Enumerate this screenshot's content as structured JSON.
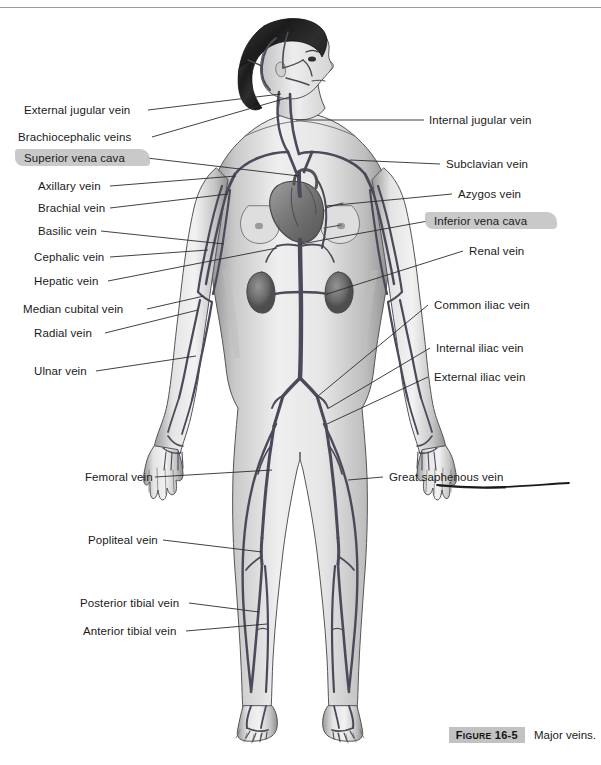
{
  "page": {
    "background_color": "#ffffff",
    "width": 601,
    "height": 765,
    "top_rule_color": "#9b9b9b"
  },
  "figure": {
    "style": "grayscale medical illustration",
    "organs_depicted": [
      "heart",
      "liver region",
      "left kidney",
      "right kidney"
    ],
    "highlight_color": "#c4c4c4",
    "leader_line_color": "#2a2a2a"
  },
  "labels_left": [
    {
      "id": "external-jugular-vein",
      "text": "External jugular vein",
      "highlighted": false
    },
    {
      "id": "brachiocephalic-veins",
      "text": "Brachiocephalic veins",
      "highlighted": false
    },
    {
      "id": "superior-vena-cava",
      "text": "Superior vena cava",
      "highlighted": true
    },
    {
      "id": "axillary-vein",
      "text": "Axillary vein",
      "highlighted": false
    },
    {
      "id": "brachial-vein",
      "text": "Brachial vein",
      "highlighted": false
    },
    {
      "id": "basilic-vein",
      "text": "Basilic vein",
      "highlighted": false
    },
    {
      "id": "cephalic-vein",
      "text": "Cephalic vein",
      "highlighted": false
    },
    {
      "id": "hepatic-vein",
      "text": "Hepatic vein",
      "highlighted": false
    },
    {
      "id": "median-cubital-vein",
      "text": "Median cubital vein",
      "highlighted": false
    },
    {
      "id": "radial-vein",
      "text": "Radial vein",
      "highlighted": false
    },
    {
      "id": "ulnar-vein",
      "text": "Ulnar vein",
      "highlighted": false
    },
    {
      "id": "femoral-vein",
      "text": "Femoral vein",
      "highlighted": false
    },
    {
      "id": "popliteal-vein",
      "text": "Popliteal vein",
      "highlighted": false
    },
    {
      "id": "posterior-tibial-vein",
      "text": "Posterior tibial vein",
      "highlighted": false
    },
    {
      "id": "anterior-tibial-vein",
      "text": "Anterior tibial vein",
      "highlighted": false
    }
  ],
  "labels_right": [
    {
      "id": "internal-jugular-vein",
      "text": "Internal jugular vein",
      "highlighted": false
    },
    {
      "id": "subclavian-vein",
      "text": "Subclavian vein",
      "highlighted": false
    },
    {
      "id": "azygos-vein",
      "text": "Azygos vein",
      "highlighted": false
    },
    {
      "id": "inferior-vena-cava",
      "text": "Inferior vena cava",
      "highlighted": true
    },
    {
      "id": "renal-vein",
      "text": "Renal vein",
      "highlighted": false
    },
    {
      "id": "common-iliac-vein",
      "text": "Common iliac vein",
      "highlighted": false
    },
    {
      "id": "internal-iliac-vein",
      "text": "Internal iliac vein",
      "highlighted": false
    },
    {
      "id": "external-iliac-vein",
      "text": "External iliac vein",
      "highlighted": false
    },
    {
      "id": "great-saphenous-vein",
      "text": "Great saphenous vein",
      "highlighted": false,
      "underlined": true
    }
  ],
  "caption": {
    "figure_label_prefix": "F",
    "figure_label_small": "IGURE",
    "figure_number": "16-5",
    "text": "Major veins.",
    "band_color": "#c2c2c2"
  }
}
